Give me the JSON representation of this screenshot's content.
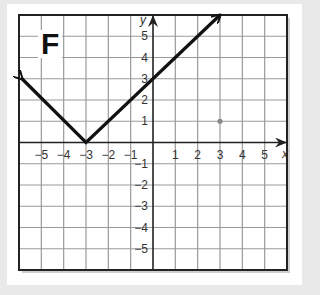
{
  "panel": {
    "label": "F"
  },
  "axes": {
    "x_label": "x",
    "y_label": "y",
    "x_ticks": [
      "-5",
      "-4",
      "-3",
      "-2",
      "-1",
      "1",
      "2",
      "3",
      "4",
      "5"
    ],
    "y_ticks": [
      "5",
      "4",
      "3",
      "2",
      "1",
      "-1",
      "-2",
      "-3",
      "-4",
      "-5"
    ]
  },
  "colors": {
    "background": "#e9e9e9",
    "card": "#ffffff",
    "grid": "#9a9a9a",
    "line": "#111111",
    "point": "#888888"
  },
  "chart_data": {
    "type": "line",
    "title": "F",
    "xlabel": "x",
    "ylabel": "y",
    "xlim": [
      -6,
      6
    ],
    "ylim": [
      -6,
      6
    ],
    "grid": true,
    "x_ticks": [
      -5,
      -4,
      -3,
      -2,
      -1,
      1,
      2,
      3,
      4,
      5
    ],
    "y_ticks": [
      -5,
      -4,
      -3,
      -2,
      -1,
      1,
      2,
      3,
      4,
      5
    ],
    "series": [
      {
        "name": "y = |x + 3|",
        "x": [
          -6,
          -3,
          3
        ],
        "y": [
          3,
          0,
          6
        ],
        "arrows": "both ends"
      }
    ],
    "annotations": [
      {
        "type": "point",
        "x": 3,
        "y": 1,
        "note": "faint gray dot"
      }
    ]
  }
}
